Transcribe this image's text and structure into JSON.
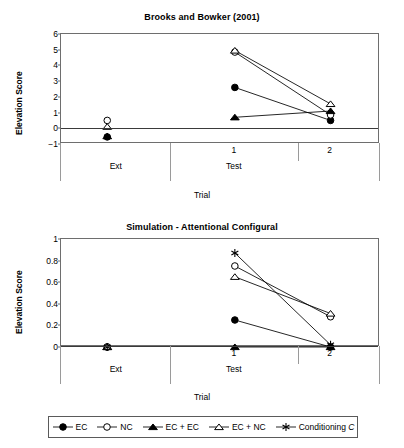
{
  "figure": {
    "axis_title_x": "Trial",
    "axis_title_y": "Elevation Score"
  },
  "legend": {
    "items": [
      {
        "label": "EC",
        "marker": "filled-circle"
      },
      {
        "label": "NC",
        "marker": "open-circle"
      },
      {
        "label": "EC + EC",
        "marker": "filled-triangle"
      },
      {
        "label": "EC + NC",
        "marker": "open-triangle"
      },
      {
        "label": "Conditioning ",
        "label_italic": "C",
        "marker": "star"
      }
    ]
  },
  "chart_data": [
    {
      "type": "line",
      "title": "Brooks and Bowker (2001)",
      "xlabel": "Trial",
      "ylabel": "Elevation Score",
      "ylim": [
        -1,
        6
      ],
      "yticks": [
        -1,
        0,
        1,
        2,
        3,
        4,
        5,
        6
      ],
      "ytick_labels": [
        "−1",
        "0",
        "1",
        "2",
        "3",
        "4",
        "5",
        "6"
      ],
      "grid": false,
      "legend_position": "below-figure",
      "x_groups": [
        {
          "label": "Ext",
          "ticks": []
        },
        {
          "label": "Test",
          "ticks": [
            "1",
            "2"
          ]
        }
      ],
      "x_categories": [
        "Ext",
        "1",
        "2"
      ],
      "series": [
        {
          "name": "EC",
          "marker": "filled-circle",
          "values": [
            -0.55,
            2.6,
            0.5
          ]
        },
        {
          "name": "NC",
          "marker": "open-circle",
          "values": [
            0.5,
            4.85,
            0.85
          ]
        },
        {
          "name": "EC + EC",
          "marker": "filled-triangle",
          "values": [
            -0.5,
            0.7,
            1.1
          ]
        },
        {
          "name": "EC + NC",
          "marker": "open-triangle",
          "values": [
            0.1,
            4.95,
            1.55
          ]
        }
      ],
      "connected_from": "1"
    },
    {
      "type": "line",
      "title": "Simulation - Attentional Configural",
      "xlabel": "Trial",
      "ylabel": "Elevation Score",
      "ylim": [
        0,
        1
      ],
      "yticks": [
        0,
        0.2,
        0.4,
        0.6,
        0.8,
        1
      ],
      "ytick_labels": [
        "0",
        "0.2",
        "0.4",
        "0.6",
        "0.8",
        "1"
      ],
      "grid": false,
      "legend_position": "below-figure",
      "x_groups": [
        {
          "label": "Ext",
          "ticks": []
        },
        {
          "label": "Test",
          "ticks": [
            "1",
            "2"
          ]
        }
      ],
      "x_categories": [
        "Ext",
        "1",
        "2"
      ],
      "series": [
        {
          "name": "EC",
          "marker": "filled-circle",
          "values": [
            0,
            0.25,
            0.0
          ]
        },
        {
          "name": "NC",
          "marker": "open-circle",
          "values": [
            0,
            0.75,
            0.28
          ]
        },
        {
          "name": "EC + EC",
          "marker": "filled-triangle",
          "values": [
            0,
            0.0,
            0.0
          ]
        },
        {
          "name": "EC + NC",
          "marker": "open-triangle",
          "values": [
            0,
            0.65,
            0.31
          ]
        },
        {
          "name": "Conditioning C",
          "marker": "star",
          "values": [
            0,
            0.87,
            0.02
          ]
        }
      ],
      "connected_from": "1"
    }
  ]
}
